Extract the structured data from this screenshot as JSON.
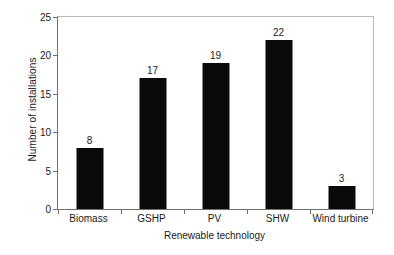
{
  "chart_data": {
    "type": "bar",
    "title": "",
    "categories": [
      "Biomass",
      "GSHP",
      "PV",
      "SHW",
      "Wind turbine"
    ],
    "values": [
      8,
      17,
      19,
      22,
      3
    ],
    "value_labels": [
      "8",
      "17",
      "19",
      "22",
      "3"
    ],
    "xlabel": "Renewable technology",
    "ylabel": "Number of installations",
    "ylim": [
      0,
      25
    ],
    "yticks": [
      0,
      5,
      10,
      15,
      20,
      25
    ],
    "ytick_labels": [
      "0",
      "5",
      "10",
      "15",
      "20",
      "25"
    ],
    "grid": false,
    "legend": false,
    "bar_color": "#0a0a0a",
    "axis_color": "#6f6f6f",
    "frame_color": "#b9b9b9",
    "background": "#ffffff"
  }
}
